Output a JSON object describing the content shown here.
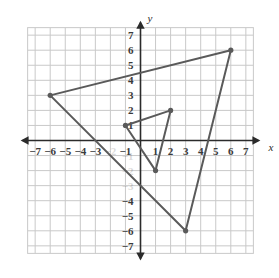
{
  "figure": {
    "background_color": "#ffffff"
  },
  "chart_data": {
    "type": "scatter",
    "title": "",
    "subtitle": "",
    "xlabel": "x",
    "ylabel": "y",
    "xlim": [
      -7.5,
      7.5
    ],
    "ylim": [
      -7.5,
      7.5
    ],
    "grid": true,
    "grid_step": 1,
    "grid_color": "#c9c9c9",
    "axis_color": "#2b2b2b",
    "legend": "none",
    "x_ticks": [
      -7,
      -6,
      -5,
      -4,
      -3,
      -2,
      -1,
      1,
      2,
      3,
      4,
      5,
      6,
      7
    ],
    "y_ticks": [
      7,
      6,
      5,
      4,
      3,
      2,
      1,
      -1,
      -2,
      -3,
      -4,
      -5,
      -6,
      -7
    ],
    "x_tick_labels": [
      "−7",
      "−6",
      "−5",
      "−4",
      "−3",
      "−2",
      "−1",
      "1",
      "2",
      "3",
      "4",
      "5",
      "6",
      "7"
    ],
    "y_tick_labels": [
      "7",
      "6",
      "5",
      "4",
      "3",
      "2",
      "1",
      "−1",
      "−2",
      "−3",
      "−4",
      "−5",
      "−6",
      "−7"
    ],
    "hidden_x_tick_labels": [
      "−2"
    ],
    "hidden_y_tick_labels": [
      "−1",
      "−2",
      "−3"
    ],
    "series": [
      {
        "name": "large-triangle",
        "type": "polygon",
        "color": "#5a5a5a",
        "line_width": 2,
        "closed": true,
        "vertex_marker": "dot",
        "points": [
          {
            "x": -6,
            "y": 3
          },
          {
            "x": 6,
            "y": 6
          },
          {
            "x": 3,
            "y": -6
          }
        ]
      },
      {
        "name": "small-triangle",
        "type": "polygon",
        "color": "#5a5a5a",
        "line_width": 2,
        "closed": true,
        "vertex_marker": "dot",
        "points": [
          {
            "x": -1,
            "y": 1
          },
          {
            "x": 2,
            "y": 2
          },
          {
            "x": 1,
            "y": -2
          }
        ]
      }
    ]
  },
  "axes": {
    "x_axis_label": "x",
    "y_axis_label": "y"
  }
}
